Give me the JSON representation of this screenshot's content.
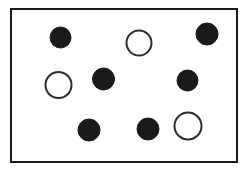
{
  "figure": {
    "canvas": {
      "width": 248,
      "height": 178,
      "background": "#ffffff"
    },
    "frame": {
      "name": "rectangular-border",
      "x": 11,
      "y": 9,
      "width": 226,
      "height": 153,
      "stroke": "#1a1a1a",
      "stroke_width": 2,
      "fill": "#ffffff"
    },
    "counts": {
      "total": 10,
      "filled": 6,
      "open": 4
    },
    "colors": {
      "filled": "#1a1a1a",
      "open_stroke": "#2b2b2b",
      "open_fill": "#ffffff",
      "frame_stroke": "#1a1a1a",
      "background": "#ffffff"
    },
    "circles": [
      {
        "id": "circle-1",
        "label": "filled-top-left",
        "type": "filled",
        "cx": 60.5,
        "cy": 37.5,
        "r": 10.5,
        "fill": "#1a1a1a",
        "stroke": "#1a1a1a",
        "stroke_width": 1
      },
      {
        "id": "circle-2",
        "label": "open-top-center",
        "type": "open",
        "cx": 139,
        "cy": 43,
        "r": 12.5,
        "fill": "#ffffff",
        "stroke": "#2b2b2b",
        "stroke_width": 2
      },
      {
        "id": "circle-3",
        "label": "filled-top-right",
        "type": "filled",
        "cx": 207,
        "cy": 34,
        "r": 11,
        "fill": "#1a1a1a",
        "stroke": "#1a1a1a",
        "stroke_width": 1
      },
      {
        "id": "circle-4",
        "label": "open-middle-left",
        "type": "open",
        "cx": 58.5,
        "cy": 85,
        "r": 13,
        "fill": "#ffffff",
        "stroke": "#2b2b2b",
        "stroke_width": 2
      },
      {
        "id": "circle-5",
        "label": "filled-middle-center",
        "type": "filled",
        "cx": 103.5,
        "cy": 79,
        "r": 11,
        "fill": "#1a1a1a",
        "stroke": "#1a1a1a",
        "stroke_width": 1
      },
      {
        "id": "circle-6",
        "label": "filled-middle-right",
        "type": "filled",
        "cx": 187.5,
        "cy": 80.5,
        "r": 10.5,
        "fill": "#1a1a1a",
        "stroke": "#1a1a1a",
        "stroke_width": 1
      },
      {
        "id": "circle-7",
        "label": "filled-bottom-left",
        "type": "filled",
        "cx": 89,
        "cy": 130,
        "r": 11,
        "fill": "#1a1a1a",
        "stroke": "#1a1a1a",
        "stroke_width": 1
      },
      {
        "id": "circle-8",
        "label": "filled-bottom-center",
        "type": "filled",
        "cx": 148,
        "cy": 129,
        "r": 11,
        "fill": "#1a1a1a",
        "stroke": "#1a1a1a",
        "stroke_width": 1
      },
      {
        "id": "circle-9",
        "label": "open-bottom-right",
        "type": "open",
        "cx": 188,
        "cy": 126,
        "r": 13.5,
        "fill": "#ffffff",
        "stroke": "#2b2b2b",
        "stroke_width": 2
      }
    ]
  }
}
